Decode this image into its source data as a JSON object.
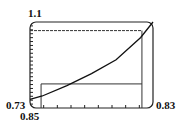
{
  "chart_data": {
    "type": "line",
    "title": "",
    "xlabel": "",
    "ylabel": "",
    "xlim": [
      0.73,
      0.83
    ],
    "ylim": [
      0.85,
      1.1
    ],
    "tick_labels": {
      "y_max": "1.1",
      "x_min": "0.73",
      "y_min": "0.85",
      "x_max": "0.83"
    },
    "grid": false,
    "series": [
      {
        "name": "curve",
        "x": [
          0.73,
          0.74,
          0.76,
          0.78,
          0.8,
          0.82,
          0.83
        ],
        "y": [
          0.875,
          0.885,
          0.915,
          0.95,
          0.99,
          1.055,
          1.1
        ]
      }
    ],
    "reference_lines": {
      "horizontal": [
        1.075,
        0.92
      ],
      "vertical": [
        0.739,
        0.821
      ]
    },
    "x_ticks_count": 9,
    "y_ticks_count": 22
  },
  "labels": {
    "y_top": "1.1",
    "x_left": "0.73",
    "y_bottom": "0.85",
    "x_right": "0.83"
  }
}
